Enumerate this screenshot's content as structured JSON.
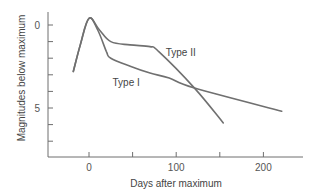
{
  "chart_data": {
    "type": "line",
    "title": "",
    "xlabel": "Days after maximum",
    "ylabel": "Magnitudes below maximum",
    "xlim": [
      -35,
      245
    ],
    "ylim": [
      8,
      -1
    ],
    "y_inverted": true,
    "grid": false,
    "x_ticks": [
      0,
      50,
      100,
      150,
      200
    ],
    "x_tick_labels": [
      "0",
      "",
      "100",
      "",
      "200"
    ],
    "y_ticks": [
      0,
      1,
      2,
      3,
      4,
      5,
      6,
      7
    ],
    "y_tick_labels": [
      "0",
      "",
      "",
      "",
      "",
      "5",
      "",
      ""
    ],
    "series": [
      {
        "name": "Type I",
        "label": "Type I",
        "x": [
          -18,
          -10,
          0,
          10,
          20,
          25,
          48,
          70,
          92,
          121,
          221
        ],
        "y": [
          2.8,
          1.2,
          -0.4,
          0.3,
          1.6,
          2.0,
          2.5,
          2.9,
          3.2,
          3.8,
          5.2
        ],
        "label_pos": {
          "x": 27,
          "y": 3.7
        }
      },
      {
        "name": "Type II",
        "label": "Type II",
        "x": [
          -18,
          -10,
          0,
          12,
          25,
          47,
          70,
          80,
          121,
          154
        ],
        "y": [
          2.8,
          1.2,
          -0.4,
          0.3,
          1.0,
          1.2,
          1.3,
          1.6,
          3.8,
          5.9
        ],
        "label_pos": {
          "x": 88,
          "y": 1.85
        }
      }
    ],
    "colors": {
      "curve": "#707070",
      "axis": "#6e6e6e",
      "text": "#444444"
    }
  }
}
